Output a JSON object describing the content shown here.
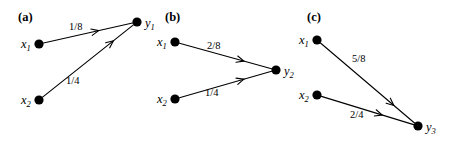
{
  "figure": {
    "width": 459,
    "height": 144,
    "background": "#ffffff",
    "ink_color": "#000000"
  },
  "panels": [
    {
      "id": "a",
      "label": "(a)",
      "label_pos": {
        "x": 18,
        "y": 11
      },
      "nodes": [
        {
          "name": "x1",
          "base": "x",
          "sub": "1",
          "cx": 39,
          "cy": 44,
          "r": 4.6,
          "label_pos": {
            "x": 21,
            "y": 38
          }
        },
        {
          "name": "x2",
          "base": "x",
          "sub": "2",
          "cx": 39,
          "cy": 100,
          "r": 4.6,
          "label_pos": {
            "x": 21,
            "y": 94
          }
        },
        {
          "name": "y1",
          "base": "y",
          "sub": "1",
          "cx": 137,
          "cy": 22,
          "r": 4.6,
          "label_pos": {
            "x": 145,
            "y": 17
          }
        }
      ],
      "edges": [
        {
          "from": "x1",
          "to": "y1",
          "weight": "1/8",
          "label_pos": {
            "x": 69,
            "y": 22
          },
          "arrow_t": 0.62
        },
        {
          "from": "x2",
          "to": "y1",
          "weight": "1/4",
          "label_pos": {
            "x": 66,
            "y": 76
          },
          "arrow_t": 0.78
        }
      ]
    },
    {
      "id": "b",
      "label": "(b)",
      "label_pos": {
        "x": 165,
        "y": 11
      },
      "nodes": [
        {
          "name": "x1",
          "base": "x",
          "sub": "1",
          "cx": 175,
          "cy": 42,
          "r": 4.6,
          "label_pos": {
            "x": 157,
            "y": 36
          }
        },
        {
          "name": "x2",
          "base": "x",
          "sub": "2",
          "cx": 175,
          "cy": 99,
          "r": 4.6,
          "label_pos": {
            "x": 157,
            "y": 93
          }
        },
        {
          "name": "y2",
          "base": "y",
          "sub": "2",
          "cx": 276,
          "cy": 70,
          "r": 4.6,
          "label_pos": {
            "x": 284,
            "y": 65
          }
        }
      ],
      "edges": [
        {
          "from": "x1",
          "to": "y2",
          "weight": "2/8",
          "label_pos": {
            "x": 207,
            "y": 41
          },
          "arrow_t": 0.7
        },
        {
          "from": "x2",
          "to": "y2",
          "weight": "1/4",
          "label_pos": {
            "x": 205,
            "y": 88
          },
          "arrow_t": 0.7
        }
      ]
    },
    {
      "id": "c",
      "label": "(c)",
      "label_pos": {
        "x": 307,
        "y": 11
      },
      "nodes": [
        {
          "name": "x1",
          "base": "x",
          "sub": "1",
          "cx": 317,
          "cy": 40,
          "r": 4.6,
          "label_pos": {
            "x": 299,
            "y": 34
          }
        },
        {
          "name": "x2",
          "base": "x",
          "sub": "2",
          "cx": 317,
          "cy": 95,
          "r": 4.6,
          "label_pos": {
            "x": 299,
            "y": 89
          }
        },
        {
          "name": "y3",
          "base": "y",
          "sub": "3",
          "cx": 418,
          "cy": 126,
          "r": 4.6,
          "label_pos": {
            "x": 426,
            "y": 121
          }
        }
      ],
      "edges": [
        {
          "from": "x1",
          "to": "y3",
          "weight": "5/8",
          "label_pos": {
            "x": 352,
            "y": 54
          },
          "arrow_t": 0.78
        },
        {
          "from": "x2",
          "to": "y3",
          "weight": "2/4",
          "label_pos": {
            "x": 350,
            "y": 110
          },
          "arrow_t": 0.66
        }
      ]
    }
  ],
  "chart_data": {
    "type": "diagram",
    "title": "",
    "subtitle": "",
    "panels": [
      {
        "id": "a",
        "sink": "y1",
        "sources": [
          "x1",
          "x2"
        ],
        "edges": [
          {
            "from": "x1",
            "to": "y1",
            "weight": "1/8",
            "value": 0.125
          },
          {
            "from": "x2",
            "to": "y1",
            "weight": "1/4",
            "value": 0.25
          }
        ]
      },
      {
        "id": "b",
        "sink": "y2",
        "sources": [
          "x1",
          "x2"
        ],
        "edges": [
          {
            "from": "x1",
            "to": "y2",
            "weight": "2/8",
            "value": 0.25
          },
          {
            "from": "x2",
            "to": "y2",
            "weight": "1/4",
            "value": 0.25
          }
        ]
      },
      {
        "id": "c",
        "sink": "y3",
        "sources": [
          "x1",
          "x2"
        ],
        "edges": [
          {
            "from": "x1",
            "to": "y3",
            "weight": "5/8",
            "value": 0.625
          },
          {
            "from": "x2",
            "to": "y3",
            "weight": "2/4",
            "value": 0.5
          }
        ]
      }
    ]
  }
}
